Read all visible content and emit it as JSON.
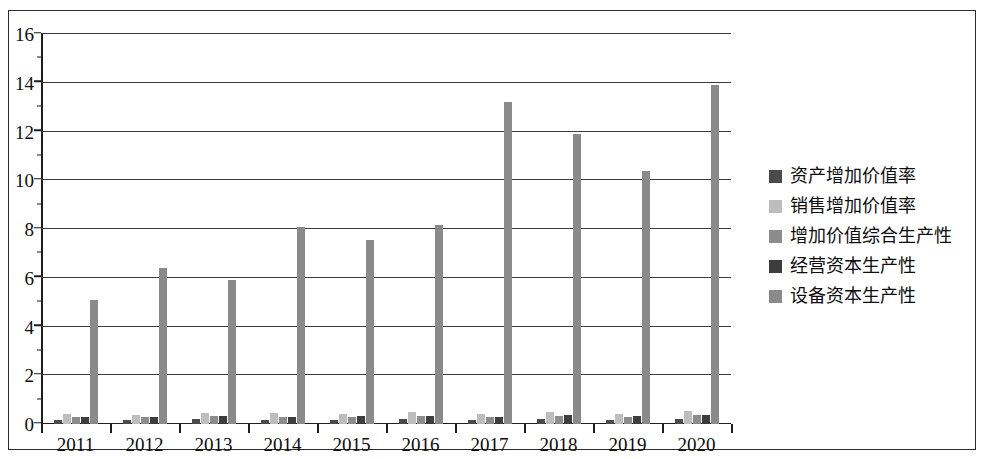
{
  "chart_data": {
    "type": "bar",
    "title": "",
    "xlabel": "",
    "ylabel": "",
    "ylim": [
      0,
      16
    ],
    "y_ticks": [
      0,
      2,
      4,
      6,
      8,
      10,
      12,
      14,
      16
    ],
    "grid": true,
    "legend_position": "right",
    "categories": [
      "2011",
      "2012",
      "2013",
      "2014",
      "2015",
      "2016",
      "2017",
      "2018",
      "2019",
      "2020"
    ],
    "series": [
      {
        "name": "资产增加价值率",
        "color": "#4a4a4a",
        "values": [
          0.18,
          0.15,
          0.2,
          0.18,
          0.17,
          0.2,
          0.17,
          0.2,
          0.18,
          0.2
        ]
      },
      {
        "name": "销售增加价值率",
        "color": "#bdbdbd",
        "values": [
          0.42,
          0.35,
          0.45,
          0.45,
          0.42,
          0.48,
          0.4,
          0.5,
          0.42,
          0.55
        ]
      },
      {
        "name": "增加价值综合生产性",
        "color": "#8c8c8c",
        "values": [
          0.3,
          0.28,
          0.32,
          0.3,
          0.3,
          0.32,
          0.3,
          0.33,
          0.3,
          0.35
        ]
      },
      {
        "name": "经营资本生产性",
        "color": "#3d3d3d",
        "values": [
          0.3,
          0.28,
          0.32,
          0.3,
          0.32,
          0.33,
          0.3,
          0.35,
          0.32,
          0.35
        ]
      },
      {
        "name": "设备资本生产性",
        "color": "#8a8a8a",
        "values": [
          5.1,
          6.4,
          5.9,
          8.1,
          7.55,
          8.15,
          13.2,
          11.9,
          10.4,
          13.9
        ]
      }
    ]
  },
  "legend": {
    "items": [
      {
        "label": "资产增加价值率",
        "color": "#4a4a4a"
      },
      {
        "label": "销售增加价值率",
        "color": "#bdbdbd"
      },
      {
        "label": "增加价值综合生产性",
        "color": "#8c8c8c"
      },
      {
        "label": "经营资本生产性",
        "color": "#3d3d3d"
      },
      {
        "label": "设备资本生产性",
        "color": "#8a8a8a"
      }
    ]
  },
  "axes": {
    "y_tick_labels": [
      "16",
      "14",
      "12",
      "10",
      "8",
      "6",
      "4",
      "2",
      "0"
    ],
    "x_tick_labels": [
      "2011",
      "2012",
      "2013",
      "2014",
      "2015",
      "2016",
      "2017",
      "2018",
      "2019",
      "2020"
    ]
  }
}
